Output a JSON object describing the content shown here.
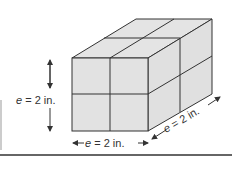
{
  "diagram": {
    "type": "rectangular prism of unit cubes (2x2x2)",
    "face_color": "#e2e2e2",
    "edge_color": "#333333",
    "labels": {
      "height": {
        "var": "e",
        "eq": "=",
        "value": "2 in."
      },
      "width": {
        "var": "e",
        "eq": "=",
        "value": "2 in."
      },
      "depth": {
        "var": "e",
        "eq": "=",
        "value": "2 in."
      }
    }
  }
}
